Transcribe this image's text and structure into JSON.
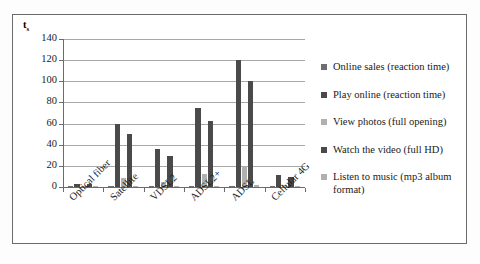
{
  "chart_data": {
    "type": "bar",
    "title": "",
    "subtitle": "",
    "xlabel": "",
    "ylabel": "t_s",
    "ylabel_display": "t",
    "ylabel_subscript": "s",
    "ylim": [
      0,
      140
    ],
    "ytick_step": 20,
    "yticks": [
      "0",
      "20",
      "40",
      "60",
      "80",
      "100",
      "120",
      "140"
    ],
    "grid": true,
    "grid_orientation": "horizontal",
    "legend_position": "right",
    "categories": [
      "Optical fiber",
      "Satellite",
      "VDSL2",
      "ADSL2+",
      "ADSL",
      "Cellular 4G"
    ],
    "series": [
      {
        "name": "Online sales (reaction time)",
        "color": "#6e6e6e",
        "values": [
          0.4,
          0.6,
          0.4,
          0.5,
          0.6,
          0.4
        ]
      },
      {
        "name": "Play online (reaction time)",
        "color": "#4a4a4a",
        "values": [
          3,
          60,
          36,
          75,
          120,
          11.5
        ]
      },
      {
        "name": "View photos (full opening)",
        "color": "#b0b0b0",
        "values": [
          0.5,
          9,
          5,
          12,
          20,
          2
        ]
      },
      {
        "name": "Watch the video (full HD)",
        "color": "#4a4a4a",
        "values": [
          2.5,
          50,
          29.5,
          62,
          100,
          9.5
        ]
      },
      {
        "name": "Listen to music (mp3 album format)",
        "color": "#b0b0b0",
        "values": [
          0.3,
          1.2,
          0.9,
          1.4,
          2.2,
          0.6
        ]
      }
    ]
  },
  "colors": {
    "frame": "#6b6b6b",
    "gridline": "#a8a8a8",
    "axis": "#6b6b6b",
    "text": "#1a1a1a",
    "background": "#ffffff",
    "series_dark": "#4a4a4a",
    "series_medium": "#6e6e6e",
    "series_light": "#b0b0b0"
  }
}
